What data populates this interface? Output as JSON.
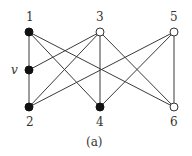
{
  "figure": {
    "caption": "(a)",
    "nodes": [
      {
        "id": "1",
        "label": "1",
        "x": 29,
        "y": 32,
        "filled": true,
        "label_x": 26,
        "label_y": 21
      },
      {
        "id": "v",
        "label": "v",
        "x": 29,
        "y": 70,
        "filled": true,
        "label_x": 11,
        "label_y": 74
      },
      {
        "id": "2",
        "label": "2",
        "x": 29,
        "y": 107,
        "filled": true,
        "label_x": 26,
        "label_y": 126
      },
      {
        "id": "3",
        "label": "3",
        "x": 100,
        "y": 32,
        "filled": false,
        "label_x": 96,
        "label_y": 21
      },
      {
        "id": "4",
        "label": "4",
        "x": 100,
        "y": 107,
        "filled": true,
        "label_x": 96,
        "label_y": 126
      },
      {
        "id": "5",
        "label": "5",
        "x": 174,
        "y": 32,
        "filled": false,
        "label_x": 170,
        "label_y": 21
      },
      {
        "id": "6",
        "label": "6",
        "x": 174,
        "y": 107,
        "filled": false,
        "label_x": 170,
        "label_y": 126
      }
    ],
    "edges": [
      [
        "1",
        "v"
      ],
      [
        "v",
        "2"
      ],
      [
        "1",
        "4"
      ],
      [
        "1",
        "6"
      ],
      [
        "v",
        "3"
      ],
      [
        "2",
        "3"
      ],
      [
        "2",
        "5"
      ],
      [
        "3",
        "4"
      ],
      [
        "3",
        "6"
      ],
      [
        "4",
        "5"
      ],
      [
        "5",
        "6"
      ]
    ],
    "colors": {
      "edge": "#3a3a3a",
      "filled": "#111111",
      "open_fill": "#ffffff"
    }
  }
}
